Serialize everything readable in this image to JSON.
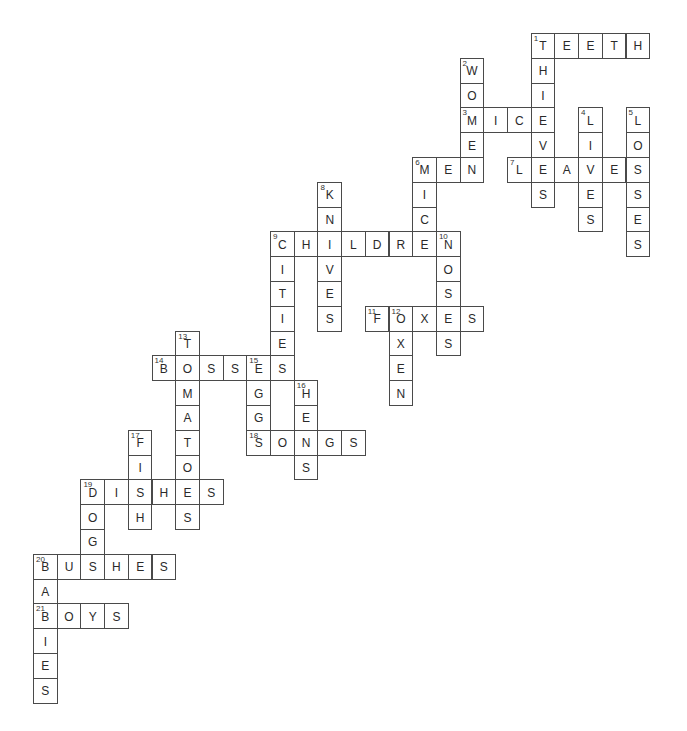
{
  "puzzle": {
    "grid": {
      "origin_x": 33,
      "origin_y": 33,
      "cell_w": 23.7,
      "cell_h": 24.8,
      "cols": 26,
      "rows": 27
    },
    "colors": {
      "border": "#4a4a4a",
      "letter": "#2a2a2a",
      "background": "#ffffff"
    },
    "words": [
      {
        "num": 1,
        "answer": "TEETH",
        "dir": "across",
        "row": 0,
        "col": 21
      },
      {
        "num": 1,
        "answer": "THIEVES",
        "dir": "down",
        "row": 0,
        "col": 21
      },
      {
        "num": 2,
        "answer": "WOMEN",
        "dir": "down",
        "row": 1,
        "col": 18
      },
      {
        "num": 3,
        "answer": "MICE",
        "dir": "across",
        "row": 3,
        "col": 18
      },
      {
        "num": 4,
        "answer": "LIVES",
        "dir": "down",
        "row": 3,
        "col": 23
      },
      {
        "num": 5,
        "answer": "LOSSES",
        "dir": "down",
        "row": 3,
        "col": 25
      },
      {
        "num": 6,
        "answer": "MEN",
        "dir": "across",
        "row": 5,
        "col": 16
      },
      {
        "num": 6,
        "answer": "MICE",
        "dir": "down",
        "row": 5,
        "col": 16
      },
      {
        "num": 7,
        "answer": "LEAVES",
        "dir": "across",
        "row": 5,
        "col": 20
      },
      {
        "num": 8,
        "answer": "KNIVES",
        "dir": "down",
        "row": 6,
        "col": 12
      },
      {
        "num": 9,
        "answer": "CHILDREN",
        "dir": "across",
        "row": 8,
        "col": 10
      },
      {
        "num": 9,
        "answer": "CITIES",
        "dir": "down",
        "row": 8,
        "col": 10
      },
      {
        "num": 10,
        "answer": "NOSES",
        "dir": "down",
        "row": 8,
        "col": 17
      },
      {
        "num": 11,
        "answer": "FOXES",
        "dir": "across",
        "row": 11,
        "col": 14
      },
      {
        "num": 12,
        "answer": "OXEN",
        "dir": "down",
        "row": 11,
        "col": 15
      },
      {
        "num": 13,
        "answer": "TOMATOES",
        "dir": "down",
        "row": 12,
        "col": 6
      },
      {
        "num": 14,
        "answer": "BOSSES",
        "dir": "across",
        "row": 13,
        "col": 5
      },
      {
        "num": 15,
        "answer": "EGGS",
        "dir": "down",
        "row": 13,
        "col": 9
      },
      {
        "num": 16,
        "answer": "HENS",
        "dir": "down",
        "row": 14,
        "col": 11
      },
      {
        "num": 17,
        "answer": "FISH",
        "dir": "down",
        "row": 16,
        "col": 4
      },
      {
        "num": 18,
        "answer": "SONGS",
        "dir": "across",
        "row": 16,
        "col": 9
      },
      {
        "num": 19,
        "answer": "DISHES",
        "dir": "across",
        "row": 18,
        "col": 2
      },
      {
        "num": 19,
        "answer": "DOGS",
        "dir": "down",
        "row": 18,
        "col": 2
      },
      {
        "num": 20,
        "answer": "BUSHES",
        "dir": "across",
        "row": 21,
        "col": 0
      },
      {
        "num": 20,
        "answer": "BABIES",
        "dir": "down",
        "row": 21,
        "col": 0
      },
      {
        "num": 21,
        "answer": "BOYS",
        "dir": "across",
        "row": 23,
        "col": 0
      }
    ]
  }
}
